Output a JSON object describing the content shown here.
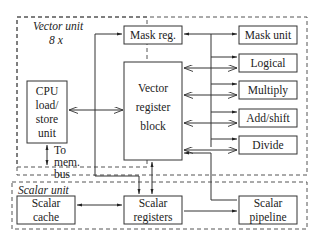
{
  "diagram": {
    "vector_unit": {
      "label": "Vector unit",
      "multiplier": "8 x",
      "cpu_ls": [
        "CPU",
        "load/",
        "store",
        "unit"
      ],
      "mem_bus": [
        "To",
        "mem.",
        "bus"
      ],
      "mask_reg": "Mask reg.",
      "vrb": [
        "Vector",
        "register",
        "block"
      ],
      "units": [
        "Mask unit",
        "Logical",
        "Multiply",
        "Add/shift",
        "Divide"
      ]
    },
    "scalar_unit": {
      "label": "Scalar unit",
      "cache": [
        "Scalar",
        "cache"
      ],
      "registers": [
        "Scalar",
        "registers"
      ],
      "pipeline": [
        "Scalar",
        "pipeline"
      ]
    },
    "colors": {
      "stroke": "#333333",
      "text": "#222222",
      "background": "#ffffff"
    }
  }
}
